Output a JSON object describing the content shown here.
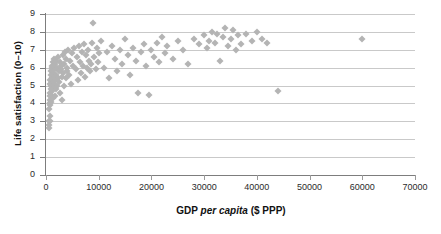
{
  "chart_data": {
    "type": "scatter",
    "title": "",
    "xlabel": "GDP per capita ($ PPP)",
    "xlabel_parts": {
      "pre": "GDP ",
      "italic": "per capita",
      "post": " ($ PPP)"
    },
    "ylabel": "Life satisfaction (0–10)",
    "xlim": [
      0,
      70000
    ],
    "ylim": [
      0,
      9
    ],
    "xticks": [
      0,
      10000,
      20000,
      30000,
      40000,
      50000,
      60000,
      70000
    ],
    "xtick_labels": [
      "0",
      "10000",
      "20000",
      "30000",
      "40000",
      "50000",
      "60000",
      "70000"
    ],
    "yticks": [
      0,
      1,
      2,
      3,
      4,
      5,
      6,
      7,
      8,
      9
    ],
    "ytick_labels": [
      "0",
      "1",
      "2",
      "3",
      "4",
      "5",
      "6",
      "7",
      "8",
      "9"
    ],
    "grid": {
      "horizontal": true,
      "vertical": false,
      "color": "#c9c9c9"
    },
    "legend": null,
    "marker": {
      "shape": "diamond",
      "color": "#b4b4b4",
      "size_px": 5
    },
    "series": [
      {
        "name": "Countries",
        "points": [
          [
            600,
            3.7
          ],
          [
            620,
            3.0
          ],
          [
            640,
            2.8
          ],
          [
            660,
            2.6
          ],
          [
            680,
            3.0
          ],
          [
            700,
            3.9
          ],
          [
            720,
            4.2
          ],
          [
            740,
            4.6
          ],
          [
            760,
            5.1
          ],
          [
            780,
            4.0
          ],
          [
            800,
            3.3
          ],
          [
            820,
            4.4
          ],
          [
            850,
            5.3
          ],
          [
            870,
            4.8
          ],
          [
            900,
            5.6
          ],
          [
            920,
            4.1
          ],
          [
            950,
            5.0
          ],
          [
            980,
            5.8
          ],
          [
            1000,
            4.5
          ],
          [
            1050,
            6.1
          ],
          [
            1100,
            5.4
          ],
          [
            1150,
            4.7
          ],
          [
            1200,
            6.0
          ],
          [
            1250,
            5.2
          ],
          [
            1300,
            4.3
          ],
          [
            1350,
            5.7
          ],
          [
            1400,
            6.3
          ],
          [
            1450,
            4.9
          ],
          [
            1500,
            5.5
          ],
          [
            1550,
            6.5
          ],
          [
            1600,
            5.1
          ],
          [
            1650,
            4.4
          ],
          [
            1700,
            5.9
          ],
          [
            1750,
            6.2
          ],
          [
            1800,
            5.3
          ],
          [
            1850,
            4.8
          ],
          [
            1900,
            6.4
          ],
          [
            1950,
            5.6
          ],
          [
            2000,
            5.0
          ],
          [
            2100,
            6.0
          ],
          [
            2200,
            5.4
          ],
          [
            2300,
            6.6
          ],
          [
            2400,
            5.8
          ],
          [
            2500,
            5.2
          ],
          [
            2600,
            6.3
          ],
          [
            2700,
            4.6
          ],
          [
            2800,
            5.9
          ],
          [
            2900,
            6.1
          ],
          [
            3000,
            5.5
          ],
          [
            3100,
            4.2
          ],
          [
            3200,
            6.7
          ],
          [
            3300,
            5.7
          ],
          [
            3400,
            6.2
          ],
          [
            3500,
            5.0
          ],
          [
            3600,
            6.9
          ],
          [
            3700,
            5.4
          ],
          [
            3800,
            6.5
          ],
          [
            3900,
            5.8
          ],
          [
            4000,
            6.0
          ],
          [
            4200,
            7.0
          ],
          [
            4400,
            5.6
          ],
          [
            4600,
            6.4
          ],
          [
            4800,
            5.1
          ],
          [
            5000,
            6.8
          ],
          [
            5200,
            6.1
          ],
          [
            5400,
            7.1
          ],
          [
            5600,
            5.9
          ],
          [
            5800,
            6.6
          ],
          [
            6000,
            5.3
          ],
          [
            6200,
            7.2
          ],
          [
            6400,
            6.3
          ],
          [
            6600,
            5.7
          ],
          [
            6800,
            6.9
          ],
          [
            7000,
            6.1
          ],
          [
            7200,
            7.3
          ],
          [
            7400,
            5.5
          ],
          [
            7600,
            6.7
          ],
          [
            7800,
            6.0
          ],
          [
            8000,
            7.0
          ],
          [
            8200,
            6.4
          ],
          [
            8400,
            5.8
          ],
          [
            8600,
            6.2
          ],
          [
            8800,
            7.4
          ],
          [
            9000,
            8.5
          ],
          [
            9200,
            6.6
          ],
          [
            9400,
            5.9
          ],
          [
            9600,
            7.1
          ],
          [
            9800,
            6.3
          ],
          [
            10000,
            6.8
          ],
          [
            10500,
            7.5
          ],
          [
            11000,
            6.0
          ],
          [
            11500,
            6.9
          ],
          [
            12000,
            5.4
          ],
          [
            12500,
            7.2
          ],
          [
            13000,
            6.5
          ],
          [
            13500,
            5.8
          ],
          [
            14000,
            7.0
          ],
          [
            14500,
            6.2
          ],
          [
            15000,
            7.6
          ],
          [
            15500,
            6.7
          ],
          [
            16000,
            5.6
          ],
          [
            16500,
            7.1
          ],
          [
            17000,
            6.4
          ],
          [
            17500,
            4.6
          ],
          [
            18000,
            6.9
          ],
          [
            18500,
            7.3
          ],
          [
            19000,
            6.1
          ],
          [
            19500,
            4.5
          ],
          [
            20000,
            7.0
          ],
          [
            20500,
            6.6
          ],
          [
            21000,
            7.4
          ],
          [
            21500,
            6.3
          ],
          [
            22000,
            7.7
          ],
          [
            22500,
            6.8
          ],
          [
            23000,
            7.2
          ],
          [
            24000,
            6.5
          ],
          [
            25000,
            7.5
          ],
          [
            26000,
            7.0
          ],
          [
            27000,
            6.2
          ],
          [
            28000,
            7.6
          ],
          [
            29000,
            7.3
          ],
          [
            30000,
            7.8
          ],
          [
            30500,
            7.1
          ],
          [
            31000,
            7.5
          ],
          [
            31500,
            8.0
          ],
          [
            32000,
            7.4
          ],
          [
            32500,
            7.9
          ],
          [
            33000,
            6.4
          ],
          [
            33500,
            7.7
          ],
          [
            34000,
            8.2
          ],
          [
            34500,
            7.2
          ],
          [
            35000,
            7.6
          ],
          [
            35500,
            8.1
          ],
          [
            36000,
            7.0
          ],
          [
            36500,
            7.8
          ],
          [
            37000,
            7.3
          ],
          [
            38000,
            7.9
          ],
          [
            39000,
            7.5
          ],
          [
            40000,
            8.0
          ],
          [
            41000,
            7.6
          ],
          [
            42000,
            7.4
          ],
          [
            44000,
            4.7
          ],
          [
            60000,
            7.6
          ]
        ]
      }
    ]
  }
}
